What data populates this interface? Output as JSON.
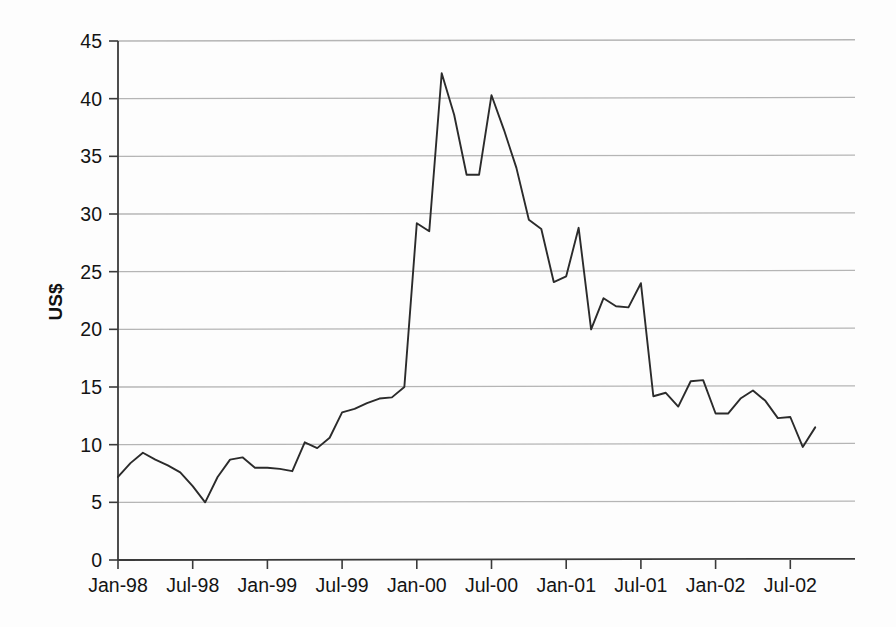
{
  "chart_data": {
    "type": "line",
    "title": "",
    "subtitle": "",
    "xlabel": "",
    "ylabel": "US$",
    "ylim": [
      0,
      45
    ],
    "ytick_step": 5,
    "yticks": [
      "0",
      "5",
      "10",
      "15",
      "20",
      "25",
      "30",
      "35",
      "40",
      "45"
    ],
    "xticks": [
      "Jan-98",
      "Jul-98",
      "Jan-99",
      "Jul-99",
      "Jan-00",
      "Jul-00",
      "Jan-01",
      "Jul-01",
      "Jan-02",
      "Jul-02"
    ],
    "xtick_months": [
      0,
      6,
      12,
      18,
      24,
      30,
      36,
      42,
      48,
      54
    ],
    "grid": "horizontal",
    "legend": "none",
    "series_color": "#2b2b2b",
    "grid_color": "#b5b5b5",
    "axis_color": "#3a3a3a",
    "x": [
      "Jan-98",
      "Feb-98",
      "Mar-98",
      "Apr-98",
      "May-98",
      "Jun-98",
      "Jul-98",
      "Aug-98",
      "Sep-98",
      "Oct-98",
      "Nov-98",
      "Dec-98",
      "Jan-99",
      "Feb-99",
      "Mar-99",
      "Apr-99",
      "May-99",
      "Jun-99",
      "Jul-99",
      "Aug-99",
      "Sep-99",
      "Oct-99",
      "Nov-99",
      "Dec-99",
      "Jan-00",
      "Feb-00",
      "Mar-00",
      "Apr-00",
      "May-00",
      "Jun-00",
      "Jul-00",
      "Aug-00",
      "Sep-00",
      "Oct-00",
      "Nov-00",
      "Dec-00",
      "Jan-01",
      "Feb-01",
      "Mar-01",
      "Apr-01",
      "May-01",
      "Jun-01",
      "Jul-01",
      "Aug-01",
      "Sep-01",
      "Oct-01",
      "Nov-01",
      "Dec-01",
      "Jan-02",
      "Feb-02",
      "Mar-02",
      "Apr-02",
      "May-02",
      "Jun-02",
      "Jul-02",
      "Aug-02",
      "Sep-02"
    ],
    "series": [
      {
        "name": "US$ price",
        "values": [
          7.2,
          8.4,
          9.3,
          8.7,
          8.2,
          7.6,
          6.4,
          5.0,
          7.2,
          8.7,
          8.9,
          8.0,
          8.0,
          7.9,
          7.7,
          10.2,
          9.7,
          10.6,
          12.8,
          13.1,
          13.6,
          14.0,
          14.1,
          15.0,
          29.2,
          28.5,
          42.2,
          38.6,
          33.4,
          33.4,
          40.3,
          37.3,
          34.0,
          29.5,
          28.7,
          24.1,
          24.6,
          28.8,
          20.0,
          22.7,
          22.0,
          21.9,
          24.0,
          14.2,
          14.5,
          13.3,
          15.5,
          15.6,
          12.7,
          12.7,
          14.0,
          14.7,
          13.8,
          12.3,
          12.4,
          9.8,
          11.5
        ]
      }
    ]
  },
  "axis": {
    "ylabel_text": "US$"
  }
}
